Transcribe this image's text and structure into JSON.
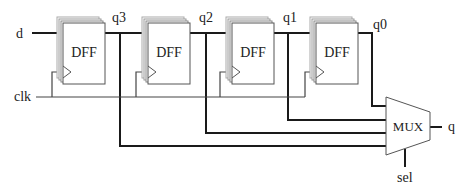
{
  "diagram": {
    "type": "shift register with multiplexer",
    "blocks": [
      {
        "id": "dff3",
        "label": "DFF",
        "x": 63,
        "output": "q3",
        "qx": 120,
        "muxY": 146
      },
      {
        "id": "dff2",
        "label": "DFF",
        "x": 148,
        "output": "q2",
        "qx": 206,
        "muxY": 133
      },
      {
        "id": "dff1",
        "label": "DFF",
        "x": 232,
        "output": "q1",
        "qx": 288,
        "muxY": 120
      },
      {
        "id": "dff0",
        "label": "DFF",
        "x": 316,
        "output": "q0",
        "qx": 372,
        "muxY": 106
      }
    ],
    "inputs": {
      "d": "d",
      "clk": "clk",
      "sel": "sel"
    },
    "outputs": {
      "q3": "q3",
      "q2": "q2",
      "q1": "q1",
      "q0": "q0",
      "q": "q"
    },
    "mux": {
      "label": "MUX"
    },
    "colors": {
      "wire": "#1a1a1a",
      "box": "#555555",
      "shadow": "#999999"
    }
  }
}
